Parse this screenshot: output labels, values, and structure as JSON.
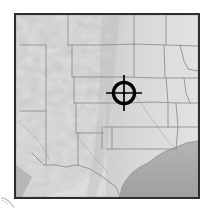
{
  "figure": {
    "kind": "shaded-relief-map-thumbnail",
    "canvas": {
      "width": 208,
      "height": 210
    },
    "background_color": "#ffffff"
  },
  "map": {
    "name": "relief-map",
    "region_label": "Western and Central United States",
    "frame": {
      "left": 14,
      "top": 13,
      "width": 186,
      "height": 186,
      "border_color": "#2e2e2e",
      "border_width": 2
    },
    "style": "grayscale hillshade",
    "land_color": "#d8d8d8",
    "highland_color": "#efefef",
    "lowland_color": "#c6c6c6",
    "water_color": "#a8a8a8",
    "boundary_color": "#8d8d8d",
    "shadow_color": "#6f6f6f",
    "features": [
      {
        "label": "Rocky Mountains",
        "type": "mountain-range"
      },
      {
        "label": "Great Basin",
        "type": "basin"
      },
      {
        "label": "Great Plains",
        "type": "plains"
      },
      {
        "label": "Gulf of Mexico",
        "type": "water-body"
      },
      {
        "label": "Pacific Ocean",
        "type": "water-body"
      },
      {
        "label": "state-boundaries",
        "type": "political-lines"
      },
      {
        "label": "international-boundary-mexico",
        "type": "political-lines"
      }
    ]
  },
  "marker": {
    "name": "target-reticle",
    "type": "crosshair",
    "center_x": 128,
    "center_y": 97,
    "ring_radius": 12,
    "ring_stroke_width": 3.2,
    "tick_length": 11,
    "tick_stroke_width": 1.6,
    "dot_radius": 1.5,
    "color": "#000000",
    "description": "Black crosshair target marker over the central plains"
  },
  "corner_mark": {
    "name": "corner-swoosh-mark",
    "color": "#9a9a9a",
    "description": "Small faint gray curved mark at lower-left outside the map frame"
  }
}
